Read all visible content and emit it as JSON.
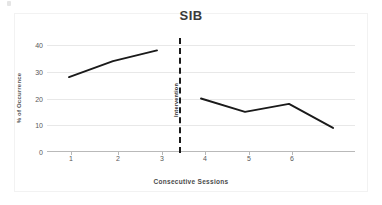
{
  "chart_data": {
    "type": "line",
    "title": "SIB",
    "xlabel": "Consecutive Sessions",
    "ylabel": "% of Occurrence",
    "ylim": [
      0,
      40
    ],
    "yticks": [
      0,
      10,
      20,
      30,
      40
    ],
    "xticks": [
      1,
      2,
      3,
      4,
      5,
      6
    ],
    "xlim": [
      0.5,
      7.5
    ],
    "grid": true,
    "legend": "none",
    "annotations": [
      {
        "text": "Intervention",
        "type": "phase-change-line",
        "x": 3.5,
        "style": "dashed-vertical"
      }
    ],
    "series": [
      {
        "name": "Baseline",
        "phase": "baseline",
        "x": [
          1,
          2,
          3
        ],
        "values": [
          28,
          34,
          38
        ]
      },
      {
        "name": "Intervention",
        "phase": "intervention",
        "x": [
          4,
          5,
          6,
          7
        ],
        "values": [
          20,
          15,
          18,
          9
        ]
      }
    ],
    "line_color": "#1a1a1a"
  },
  "labels": {
    "title": "SIB",
    "x_axis_title": "Consecutive Sessions",
    "y_axis_title": "% of Occurrence",
    "intervention_label": "Intervention",
    "y_ticks": [
      "0",
      "10",
      "20",
      "30",
      "40"
    ],
    "x_ticks": [
      "1",
      "2",
      "3",
      "4",
      "5",
      "6"
    ]
  }
}
